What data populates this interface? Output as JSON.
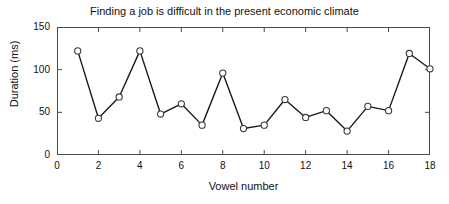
{
  "chart_data": {
    "type": "line",
    "title": "Finding a job is difficult in the present economic climate",
    "xlabel": "Vowel number",
    "ylabel": "Duration (ms)",
    "x": [
      1,
      2,
      3,
      4,
      5,
      6,
      7,
      8,
      9,
      10,
      11,
      12,
      13,
      14,
      15,
      16,
      17,
      18
    ],
    "values": [
      122,
      43,
      68,
      122,
      48,
      60,
      35,
      96,
      31,
      35,
      65,
      44,
      52,
      28,
      57,
      52,
      119,
      101
    ],
    "series": [
      {
        "name": "Duration",
        "values": [
          122,
          43,
          68,
          122,
          48,
          60,
          35,
          96,
          31,
          35,
          65,
          44,
          52,
          28,
          57,
          52,
          119,
          101
        ]
      }
    ],
    "xlim": [
      0,
      18
    ],
    "ylim": [
      0,
      150
    ],
    "xticks": [
      0,
      2,
      4,
      6,
      8,
      10,
      12,
      14,
      16,
      18
    ],
    "yticks": [
      0,
      50,
      100,
      150
    ],
    "xtick_labels": [
      "0",
      "2",
      "4",
      "6",
      "8",
      "10",
      "12",
      "14",
      "16",
      "18"
    ],
    "ytick_labels": [
      "0",
      "50",
      "100",
      "150"
    ],
    "grid": false,
    "legend": false,
    "legend_position": "none",
    "line_color": "#1a1a1a",
    "marker": "circle-open",
    "marker_face_color": "#ffffff",
    "marker_edge_color": "#3a3a3a",
    "background_color": "#ffffff",
    "axis_color": "#4a4a4a"
  }
}
